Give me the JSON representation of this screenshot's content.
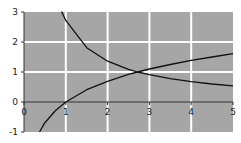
{
  "chart_data": {
    "type": "line",
    "title": "",
    "xlabel": "",
    "ylabel": "",
    "xlim": [
      0,
      5
    ],
    "ylim": [
      -1,
      3
    ],
    "x_ticks": [
      "0",
      "1",
      "2",
      "3",
      "4",
      "5"
    ],
    "y_ticks": [
      "-1",
      "0",
      "1",
      "2",
      "3"
    ],
    "grid": true,
    "background": "#a6a6a6",
    "grid_color": "#ffffff",
    "legend": null,
    "series": [
      {
        "name": "e/x",
        "color": "#111111",
        "x": [
          0.9,
          1.0,
          1.5,
          2.0,
          2.5,
          2.718,
          3.0,
          3.5,
          4.0,
          4.5,
          5.0
        ],
        "values": [
          3.02,
          2.72,
          1.81,
          1.36,
          1.09,
          1.0,
          0.91,
          0.78,
          0.68,
          0.6,
          0.54
        ]
      },
      {
        "name": "ln(x)",
        "color": "#111111",
        "x": [
          0.37,
          0.5,
          0.75,
          1.0,
          1.5,
          2.0,
          2.5,
          2.718,
          3.0,
          3.5,
          4.0,
          4.5,
          5.0
        ],
        "values": [
          -1.0,
          -0.69,
          -0.29,
          0.0,
          0.41,
          0.69,
          0.92,
          1.0,
          1.1,
          1.25,
          1.39,
          1.5,
          1.61
        ]
      }
    ],
    "annotations": [
      {
        "label": "intersection",
        "x": 2.718,
        "y": 1.0
      }
    ]
  }
}
